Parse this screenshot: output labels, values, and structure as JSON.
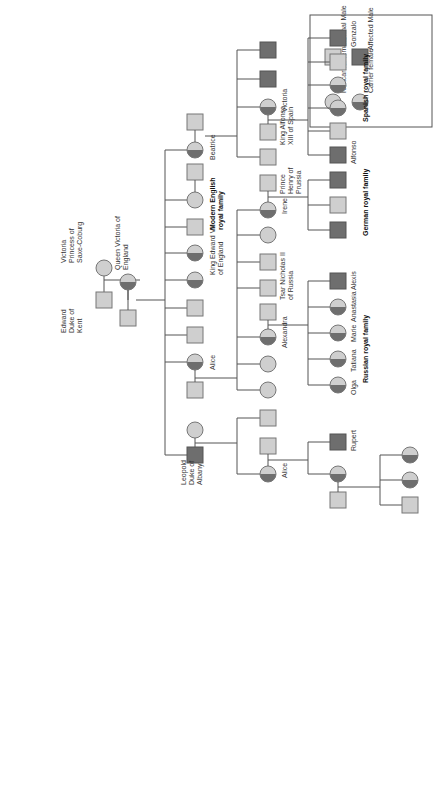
{
  "legend": {
    "noncarrier_female": "Noncarrier female",
    "carrier_female": "Carrier female",
    "normal_male": "Normal Male",
    "affected_male": "Affected Male"
  },
  "colors": {
    "normal": "#cfcfcf",
    "affected": "#6e6e6e",
    "line": "#555555"
  },
  "labels": {
    "edward": [
      "Edward",
      "Duke of",
      "Kent"
    ],
    "victoria_saxe": [
      "Victoria",
      "Princess of",
      "Saxe-Coburg"
    ],
    "queen_victoria": [
      "Queen Victoria of",
      "England"
    ],
    "leopold": [
      "Leopold",
      "Duke of",
      "Albany"
    ],
    "alice1": "Alice",
    "alice2": "Alice",
    "alexandra": "Alexandra",
    "tsar": [
      "Tsar Nicholas II",
      "of Russia"
    ],
    "edward7": [
      "King Edward VII",
      "of England"
    ],
    "modern_english": [
      "Modern English",
      "royal family"
    ],
    "irene": "Irene",
    "henry": [
      "Prince",
      "Henry of",
      "Prussia"
    ],
    "beatrice": "Beatrice",
    "victoria_sp": "Victoria",
    "alfonso13": [
      "King Alfonso",
      "XIII of Spain"
    ],
    "rupert": "Rupert",
    "olga": "Olga",
    "tatiana": "Tatiana",
    "marie": "Marie",
    "anastasia": "Anastasia",
    "alexis": "Alexis",
    "alfonso": "Alfonso",
    "gonzalo": "Gonzalo",
    "russian": "Russian royal family",
    "german": "German royal family",
    "spanish": "Spanish royal family"
  }
}
